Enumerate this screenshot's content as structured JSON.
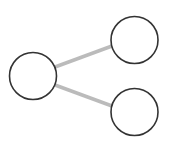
{
  "diagram": {
    "type": "share-graph",
    "colors": {
      "background": "#ffffff",
      "node_stroke": "#333333",
      "node_fill": "#ffffff",
      "edge_stroke": "#bbbbbb"
    },
    "nodes": [
      {
        "id": "left",
        "cx": 33,
        "cy": 76,
        "r": 23.5
      },
      {
        "id": "top-right",
        "cx": 134.5,
        "cy": 40,
        "r": 23.5
      },
      {
        "id": "bottom-right",
        "cx": 134.5,
        "cy": 112,
        "r": 23.5
      }
    ],
    "edges": [
      {
        "from": "left",
        "to": "top-right",
        "x1": 55,
        "y1": 67,
        "x2": 112,
        "y2": 46
      },
      {
        "from": "left",
        "to": "bottom-right",
        "x1": 55,
        "y1": 85,
        "x2": 112,
        "y2": 106
      }
    ]
  }
}
